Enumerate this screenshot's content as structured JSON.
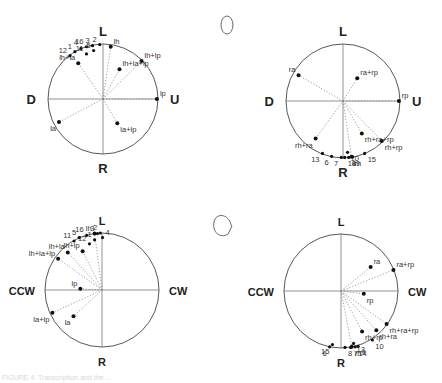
{
  "figure": {
    "icons": {
      "top": "open-ellipse-icon",
      "bottom": "ellipse-with-tail-icon"
    },
    "caption": "FIGURE 4. Transcription and the ..."
  },
  "chart_data": [
    {
      "type": "scatter",
      "panel": "top-left",
      "title": "",
      "axis_labels": {
        "top": "L",
        "bottom": "R",
        "left": "D",
        "right": "U"
      },
      "points": [
        {
          "label": "lh",
          "x": 0.14,
          "y": 0.95,
          "ray": true
        },
        {
          "label": "lh+lp",
          "x": 0.7,
          "y": 0.69,
          "ray": true
        },
        {
          "label": "lh+la+lp",
          "x": 0.3,
          "y": 0.54,
          "ray": true
        },
        {
          "label": "lp",
          "x": 0.98,
          "y": 0.0,
          "ray": true
        },
        {
          "label": "lh+la",
          "x": -0.45,
          "y": 0.65,
          "ray": true
        },
        {
          "label": "la",
          "x": -0.8,
          "y": -0.42,
          "ray": true
        },
        {
          "label": "la+lp",
          "x": 0.26,
          "y": -0.44,
          "ray": true
        },
        {
          "label": "2",
          "x": -0.06,
          "y": 0.99
        },
        {
          "label": "3",
          "x": -0.19,
          "y": 0.97
        },
        {
          "label": "16",
          "x": -0.3,
          "y": 0.95
        },
        {
          "label": "4",
          "x": -0.4,
          "y": 0.92
        },
        {
          "label": "1",
          "x": -0.51,
          "y": 0.86
        },
        {
          "label": "12",
          "x": -0.6,
          "y": 0.79
        },
        {
          "label": "5",
          "x": -0.17,
          "y": 0.88
        },
        {
          "label": "11",
          "x": -0.3,
          "y": 0.82
        }
      ]
    },
    {
      "type": "scatter",
      "panel": "top-right",
      "axis_labels": {
        "top": "L",
        "bottom": "R",
        "left": "D",
        "right": "U"
      },
      "points": [
        {
          "label": "ra",
          "x": -0.78,
          "y": 0.45,
          "ray": true
        },
        {
          "label": "ra+rp",
          "x": 0.25,
          "y": 0.4,
          "ray": true
        },
        {
          "label": "rp",
          "x": 0.98,
          "y": 0.0,
          "ray": true
        },
        {
          "label": "rh+ra+rp",
          "x": 0.33,
          "y": -0.57,
          "ray": true
        },
        {
          "label": "rh+rp",
          "x": 0.68,
          "y": -0.7,
          "ray": true
        },
        {
          "label": "rh+ra",
          "x": -0.48,
          "y": -0.66,
          "ray": true
        },
        {
          "label": "rh",
          "x": 0.15,
          "y": -0.98,
          "ray": true
        },
        {
          "label": "10",
          "x": 0.08,
          "y": -0.9
        },
        {
          "label": "13",
          "x": -0.36,
          "y": -0.92
        },
        {
          "label": "6",
          "x": -0.2,
          "y": -0.97
        },
        {
          "label": "7",
          "x": -0.03,
          "y": -0.99
        },
        {
          "label": "14",
          "x": 0.03,
          "y": -0.99
        },
        {
          "label": "8",
          "x": 0.1,
          "y": -0.99
        },
        {
          "label": "9",
          "x": 0.17,
          "y": -0.98
        },
        {
          "label": "15",
          "x": 0.38,
          "y": -0.92
        }
      ]
    },
    {
      "type": "scatter",
      "panel": "bottom-left",
      "axis_labels": {
        "top": "L",
        "bottom": "R",
        "left": "CCW",
        "right": "CW"
      },
      "points": [
        {
          "label": "lh",
          "x": -0.13,
          "y": 0.99,
          "ray": true
        },
        {
          "label": "lh+la",
          "x": -0.6,
          "y": 0.66,
          "ray": true
        },
        {
          "label": "lh+la+lp",
          "x": -0.77,
          "y": 0.55,
          "ray": true
        },
        {
          "label": "lh+lp",
          "x": -0.34,
          "y": 0.68,
          "ray": true
        },
        {
          "label": "lp",
          "x": -0.38,
          "y": 0.02,
          "ray": true
        },
        {
          "label": "la+lp",
          "x": -0.87,
          "y": -0.4,
          "ray": true
        },
        {
          "label": "la",
          "x": -0.5,
          "y": -0.46,
          "ray": true
        },
        {
          "label": "3",
          "x": -0.08,
          "y": 0.99
        },
        {
          "label": "2",
          "x": -0.03,
          "y": 1.0
        },
        {
          "label": "4",
          "x": 0.01,
          "y": 0.92
        },
        {
          "label": "1",
          "x": -0.13,
          "y": 0.88
        },
        {
          "label": "12",
          "x": -0.22,
          "y": 0.81
        },
        {
          "label": "5",
          "x": -0.4,
          "y": 0.92
        },
        {
          "label": "16",
          "x": -0.27,
          "y": 0.96
        },
        {
          "label": "11",
          "x": -0.49,
          "y": 0.86
        }
      ]
    },
    {
      "type": "scatter",
      "panel": "bottom-right",
      "axis_labels": {
        "top": "L",
        "bottom": "R",
        "left": "CCW",
        "right": "CW"
      },
      "points": [
        {
          "label": "ra",
          "x": 0.52,
          "y": 0.42,
          "ray": true
        },
        {
          "label": "ra+rp",
          "x": 0.92,
          "y": 0.37,
          "ray": true
        },
        {
          "label": "rp",
          "x": 0.4,
          "y": -0.05,
          "ray": true
        },
        {
          "label": "rh+ra+rp",
          "x": 0.8,
          "y": -0.58,
          "ray": true
        },
        {
          "label": "rh+ra",
          "x": 0.62,
          "y": -0.69,
          "ray": true
        },
        {
          "label": "rh+rp",
          "x": 0.37,
          "y": -0.71,
          "ray": true
        },
        {
          "label": "rh",
          "x": 0.19,
          "y": -0.98,
          "ray": true
        },
        {
          "label": "13",
          "x": 0.22,
          "y": -0.92
        },
        {
          "label": "10",
          "x": 0.55,
          "y": -0.86
        },
        {
          "label": "14",
          "x": 0.25,
          "y": -0.98
        },
        {
          "label": "9",
          "x": 0.3,
          "y": -0.97
        },
        {
          "label": "7",
          "x": 0.17,
          "y": -0.99
        },
        {
          "label": "8",
          "x": 0.07,
          "y": -0.99
        },
        {
          "label": "15",
          "x": -0.15,
          "y": -0.94
        },
        {
          "label": "6",
          "x": -0.2,
          "y": -0.98
        }
      ]
    }
  ]
}
